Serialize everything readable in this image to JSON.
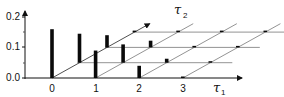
{
  "chart_data": {
    "type": "bar",
    "subtype": "3d-oblique-stem",
    "title": "",
    "xlabel": "τ1",
    "zlabel": "τ2",
    "ylabel": "",
    "x_ticks": [
      "0",
      "1",
      "2",
      "3"
    ],
    "y_ticks": [
      "0.0",
      "0.1",
      "0.2"
    ],
    "ylim": [
      0,
      0.22
    ],
    "grid": true,
    "legend": null,
    "tau1": [
      0,
      1,
      2,
      3
    ],
    "tau2": [
      0,
      1,
      2,
      3
    ],
    "series": [
      {
        "name": "τ2=0",
        "values": [
          0.16,
          0.09,
          0.04,
          0.003
        ]
      },
      {
        "name": "τ2=1",
        "values": [
          0.095,
          0.06,
          0.013,
          0.003
        ]
      },
      {
        "name": "τ2=2",
        "values": [
          0.04,
          0.022,
          0.005,
          0.003
        ]
      },
      {
        "name": "τ2=3",
        "values": [
          0.003,
          0.003,
          0.003,
          0.003
        ]
      }
    ]
  },
  "labels": {
    "y0": "0.0",
    "y1": "0.1",
    "y2": "0.2",
    "x0": "0",
    "x1": "1",
    "x2": "2",
    "x3": "3",
    "tau1_main": "τ",
    "tau1_sub": "1",
    "tau2_main": "τ",
    "tau2_sub": "2"
  }
}
